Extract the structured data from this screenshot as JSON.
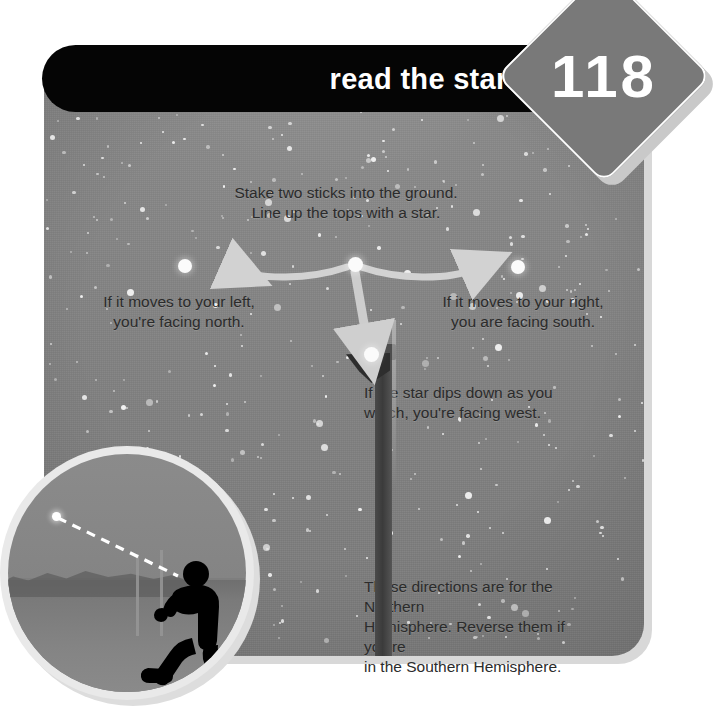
{
  "page": {
    "number": "118",
    "title": "read the stars"
  },
  "instructions": {
    "top_line_1": "Stake two sticks into the ground.",
    "top_line_2": "Line up the tops with a star.",
    "left_line_1": "If it moves to your left,",
    "left_line_2": "you're facing north.",
    "right_line_1": "If it moves to your right,",
    "right_line_2": "you are facing south.",
    "west_line_1": "If the star dips down as you",
    "west_line_2": "watch, you're facing west.",
    "note_line_1": "These directions are for the Northern",
    "note_line_2": "Hemisphere. Reverse them if you're",
    "note_line_3": "in the Southern Hemisphere."
  },
  "diagram": {
    "center_star_label": "center-star",
    "left_star_label": "left-star",
    "right_star_label": "right-star",
    "lower_star_label": "lower-star",
    "left_arrow_label": "left-motion-arrow",
    "right_arrow_label": "right-motion-arrow",
    "down_arrow_label": "down-motion-arrow",
    "pole_label": "staked-stick"
  },
  "inset": {
    "caption": "",
    "figure_label": "person-sighting-star",
    "sightline_label": "dashed-sight-line",
    "star_label": "sighted-star"
  },
  "colors": {
    "banner_bg": "#050505",
    "banner_text": "#ffffff",
    "diamond_bg": "#797979",
    "diamond_text": "#ffffff",
    "sky": "#868686",
    "body_text": "#2b2b2b",
    "star": "#fbfbfb",
    "arrow": "#d0d0d0"
  }
}
